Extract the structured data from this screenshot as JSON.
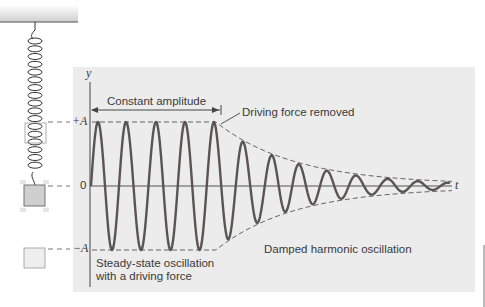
{
  "figure": {
    "type": "physics-diagram",
    "colors": {
      "panel": "#ececec",
      "wave": "#5a5555",
      "axis": "#555555",
      "dashed": "#555555",
      "spring": "#333333",
      "ceiling_line": "#555555",
      "text": "#3a3a3a",
      "mass_mid_fill": "#cfcfcf",
      "mass_bottom_fill": "#eeeeee"
    },
    "axis_labels": {
      "y": "y",
      "t": "t",
      "plus_a": "+A",
      "zero": "0",
      "minus_a": "−A"
    },
    "annotations": {
      "constant_amplitude": "Constant amplitude",
      "driving_force_removed": "Driving force removed",
      "damped": "Damped harmonic oscillation",
      "steady_state": "Steady-state oscillation\nwith a driving force"
    },
    "spring_system": {
      "positions": [
        "+A (top, outline)",
        "0 (equilibrium, filled)",
        "-A (bottom, light)"
      ]
    }
  },
  "chart_data": {
    "type": "line",
    "title": "",
    "xlabel": "t",
    "ylabel": "y",
    "y_ticks": [
      "+A",
      "0",
      "-A"
    ],
    "grid": false,
    "series": [
      {
        "name": "Steady-state oscillation with a driving force",
        "phase": "driven",
        "amplitude": 1.0,
        "cycles": 4.5,
        "peaks_x_px": [
          98,
          126,
          156,
          185,
          214
        ]
      },
      {
        "name": "Damped harmonic oscillation",
        "phase": "damped",
        "amplitude_start": 1.0,
        "amplitude_end": 0.05,
        "peaks_x_px": [
          243,
          272,
          299,
          327,
          356,
          388,
          418
        ]
      }
    ],
    "envelope": "dashed: constant at ±A until driving force removed, then exponential decay toward t-axis",
    "annotations": [
      "Constant amplitude",
      "Driving force removed",
      "Damped harmonic oscillation",
      "Steady-state oscillation with a driving force"
    ]
  }
}
